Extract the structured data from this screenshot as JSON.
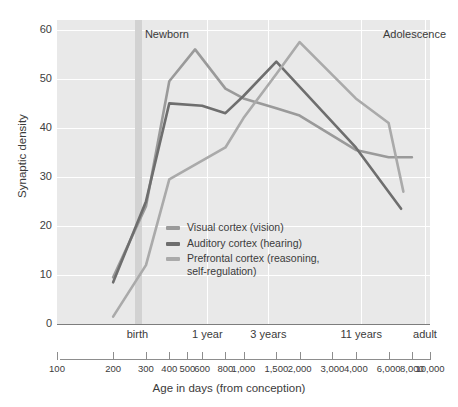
{
  "chart_data": {
    "type": "line",
    "title": "",
    "xlabel": "Age in days (from conception)",
    "ylabel": "Synaptic density",
    "xscale": "log",
    "xlim": [
      100,
      10000
    ],
    "ylim": [
      0,
      62
    ],
    "grid": true,
    "legend_position": "inside-center-left",
    "y_ticks": [
      0,
      10,
      20,
      30,
      40,
      50,
      60
    ],
    "x_ticks": [
      100,
      200,
      300,
      400,
      500,
      600,
      800,
      1000,
      1500,
      2000,
      3000,
      4000,
      6000,
      8000,
      10000
    ],
    "x_tick_labels": [
      "100",
      "200",
      "300",
      "400",
      "500",
      "600",
      "800",
      "1,000",
      "1,500",
      "2,000",
      "3,000",
      "4,000",
      "6,000",
      "8,000",
      "10,000"
    ],
    "secondary_x_ticks": [
      {
        "label": "birth",
        "value": 270
      },
      {
        "label": "1 year",
        "value": 640
      },
      {
        "label": "3 years",
        "value": 1360
      },
      {
        "label": "11 years",
        "value": 4280
      },
      {
        "label": "adult",
        "value": 9400
      }
    ],
    "annotations": [
      {
        "label": "Newborn",
        "value": 275,
        "y": 59
      },
      {
        "label": "Adolescence",
        "value": 5200,
        "y": 59
      }
    ],
    "newborn_band": {
      "from": 262,
      "to": 284
    },
    "series": [
      {
        "name": "Visual cortex (vision)",
        "color": "#9a9a9a",
        "x": [
          200,
          300,
          400,
          550,
          800,
          1000,
          1500,
          2000,
          4000,
          6000,
          8000
        ],
        "y": [
          9.5,
          24,
          49.5,
          56,
          48,
          46,
          44,
          42.5,
          35.5,
          34,
          34
        ]
      },
      {
        "name": "Auditory cortex (hearing)",
        "color": "#6e6e6e",
        "x": [
          200,
          300,
          400,
          600,
          800,
          1000,
          1500,
          4000,
          7000
        ],
        "y": [
          8.5,
          25,
          45,
          44.5,
          43,
          46.5,
          53.5,
          36,
          23.5
        ]
      },
      {
        "name": "Prefrontal cortex (reasoning,\nself-regulation)",
        "color": "#aaaaaa",
        "x": [
          200,
          300,
          400,
          800,
          1000,
          1500,
          2000,
          4000,
          6000,
          7200
        ],
        "y": [
          1.5,
          12,
          29.5,
          36,
          42,
          51,
          57.5,
          46,
          41,
          27
        ]
      }
    ]
  },
  "legend": {
    "items": [
      {
        "label": "Visual cortex (vision)"
      },
      {
        "label": "Auditory cortex (hearing)"
      },
      {
        "label": "Prefrontal cortex (reasoning,\nself-regulation)"
      }
    ]
  }
}
